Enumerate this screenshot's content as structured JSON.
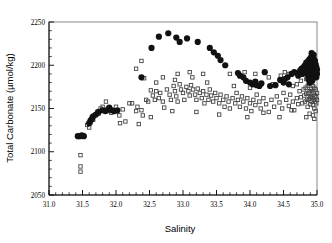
{
  "chart_data": {
    "type": "scatter",
    "title": "",
    "xlabel": "Salinity",
    "ylabel": "Total Carbonate (µmol/kg)",
    "xlim": [
      31.0,
      35.0
    ],
    "ylim": [
      2050,
      2250
    ],
    "xticks": [
      31.0,
      31.5,
      32.0,
      32.5,
      33.0,
      33.5,
      34.0,
      34.5,
      35.0
    ],
    "xticklabels": [
      "31.0",
      "31.5",
      "32.0",
      "32.5",
      "33.0",
      "33.5",
      "34.0",
      "34.5",
      "35.0"
    ],
    "yticks": [
      2050,
      2100,
      2150,
      2200,
      2250
    ],
    "yticklabels": [
      "2050",
      "2100",
      "2150",
      "2200",
      "2250"
    ],
    "x_minor_per_major": 5,
    "y_minor_per_major": 5,
    "grid": false,
    "legend": null,
    "colors": {
      "filled_marker": "#111111",
      "open_marker": "#444444",
      "axis": "#000000",
      "frame": "#888888",
      "background": "#ffffff"
    },
    "series": [
      {
        "name": "filled-circles",
        "marker": "filled-circle",
        "marker_size": 4.0,
        "points": [
          [
            31.43,
            2118
          ],
          [
            31.46,
            2118
          ],
          [
            31.49,
            2119
          ],
          [
            31.52,
            2118
          ],
          [
            31.6,
            2133
          ],
          [
            31.62,
            2136
          ],
          [
            31.64,
            2138
          ],
          [
            31.66,
            2141
          ],
          [
            31.7,
            2143
          ],
          [
            31.74,
            2146
          ],
          [
            31.8,
            2148
          ],
          [
            31.84,
            2147
          ],
          [
            31.86,
            2148
          ],
          [
            31.9,
            2151
          ],
          [
            31.94,
            2148
          ],
          [
            31.97,
            2147
          ],
          [
            32.02,
            2148
          ],
          [
            32.38,
            2186
          ],
          [
            32.53,
            2220
          ],
          [
            32.64,
            2233
          ],
          [
            32.78,
            2237
          ],
          [
            32.9,
            2232
          ],
          [
            32.95,
            2227
          ],
          [
            33.06,
            2231
          ],
          [
            33.22,
            2227
          ],
          [
            33.4,
            2220
          ],
          [
            33.46,
            2215
          ],
          [
            33.52,
            2211
          ],
          [
            33.56,
            2206
          ],
          [
            33.63,
            2200
          ],
          [
            33.82,
            2191
          ],
          [
            33.85,
            2188
          ],
          [
            33.9,
            2186
          ],
          [
            33.94,
            2182
          ],
          [
            34.0,
            2180
          ],
          [
            34.04,
            2178
          ],
          [
            34.08,
            2181
          ],
          [
            34.1,
            2177
          ],
          [
            34.14,
            2176
          ],
          [
            34.17,
            2179
          ],
          [
            34.22,
            2192
          ],
          [
            34.3,
            2176
          ],
          [
            34.38,
            2177
          ],
          [
            34.45,
            2183
          ],
          [
            34.5,
            2180
          ],
          [
            34.52,
            2184
          ],
          [
            34.56,
            2186
          ],
          [
            34.58,
            2178
          ],
          [
            34.62,
            2190
          ],
          [
            34.66,
            2192
          ],
          [
            34.7,
            2191
          ],
          [
            34.72,
            2188
          ],
          [
            34.75,
            2194
          ],
          [
            34.77,
            2196
          ],
          [
            34.78,
            2190
          ],
          [
            34.8,
            2198
          ],
          [
            34.81,
            2192
          ],
          [
            34.82,
            2200
          ],
          [
            34.83,
            2195
          ],
          [
            34.84,
            2203
          ],
          [
            34.85,
            2197
          ],
          [
            34.85,
            2190
          ],
          [
            34.86,
            2201
          ],
          [
            34.86,
            2193
          ],
          [
            34.87,
            2205
          ],
          [
            34.87,
            2196
          ],
          [
            34.88,
            2188
          ],
          [
            34.88,
            2199
          ],
          [
            34.89,
            2207
          ],
          [
            34.89,
            2192
          ],
          [
            34.9,
            2202
          ],
          [
            34.9,
            2195
          ],
          [
            34.9,
            2186
          ],
          [
            34.91,
            2209
          ],
          [
            34.91,
            2198
          ],
          [
            34.91,
            2190
          ],
          [
            34.92,
            2204
          ],
          [
            34.92,
            2194
          ],
          [
            34.92,
            2200
          ],
          [
            34.93,
            2188
          ],
          [
            34.93,
            2196
          ],
          [
            34.93,
            2206
          ],
          [
            34.94,
            2192
          ],
          [
            34.94,
            2201
          ],
          [
            34.94,
            2185
          ],
          [
            34.95,
            2198
          ],
          [
            34.95,
            2208
          ],
          [
            34.95,
            2190
          ],
          [
            34.96,
            2194
          ],
          [
            34.96,
            2203
          ],
          [
            34.96,
            2187
          ],
          [
            34.97,
            2199
          ],
          [
            34.97,
            2191
          ],
          [
            34.97,
            2205
          ],
          [
            34.98,
            2196
          ],
          [
            34.98,
            2189
          ],
          [
            34.98,
            2201
          ],
          [
            34.99,
            2193
          ],
          [
            34.99,
            2198
          ],
          [
            34.99,
            2186
          ],
          [
            35.0,
            2195
          ],
          [
            35.0,
            2190
          ],
          [
            34.87,
            2184
          ],
          [
            34.93,
            2182
          ],
          [
            34.89,
            2180
          ],
          [
            34.95,
            2212
          ],
          [
            34.92,
            2214
          ]
        ]
      },
      {
        "name": "open-squares",
        "marker": "open-square",
        "marker_size": 3.4,
        "points": [
          [
            31.47,
            2096
          ],
          [
            31.47,
            2083
          ],
          [
            31.47,
            2077
          ],
          [
            31.57,
            2131
          ],
          [
            31.6,
            2128
          ],
          [
            31.62,
            2134
          ],
          [
            31.64,
            2140
          ],
          [
            31.66,
            2137
          ],
          [
            31.7,
            2143
          ],
          [
            31.72,
            2146
          ],
          [
            31.74,
            2144
          ],
          [
            31.77,
            2150
          ],
          [
            31.8,
            2152
          ],
          [
            31.82,
            2148
          ],
          [
            31.85,
            2158
          ],
          [
            31.88,
            2150
          ],
          [
            31.9,
            2147
          ],
          [
            31.93,
            2145
          ],
          [
            31.96,
            2148
          ],
          [
            32.0,
            2152
          ],
          [
            32.02,
            2146
          ],
          [
            32.05,
            2142
          ],
          [
            32.1,
            2149
          ],
          [
            32.14,
            2135
          ],
          [
            32.2,
            2156
          ],
          [
            32.24,
            2156
          ],
          [
            32.3,
            2147
          ],
          [
            32.32,
            2152
          ],
          [
            32.38,
            2148
          ],
          [
            32.4,
            2142
          ],
          [
            32.45,
            2160
          ],
          [
            32.48,
            2158
          ],
          [
            32.52,
            2171
          ],
          [
            32.55,
            2165
          ],
          [
            32.58,
            2160
          ],
          [
            32.6,
            2170
          ],
          [
            32.64,
            2162
          ],
          [
            32.66,
            2168
          ],
          [
            32.7,
            2158
          ],
          [
            32.72,
            2151
          ],
          [
            32.76,
            2172
          ],
          [
            32.8,
            2166
          ],
          [
            32.82,
            2160
          ],
          [
            32.86,
            2176
          ],
          [
            32.88,
            2170
          ],
          [
            32.9,
            2164
          ],
          [
            32.92,
            2158
          ],
          [
            32.95,
            2178
          ],
          [
            32.97,
            2172
          ],
          [
            33.0,
            2168
          ],
          [
            33.02,
            2160
          ],
          [
            33.05,
            2175
          ],
          [
            33.08,
            2170
          ],
          [
            33.1,
            2165
          ],
          [
            33.12,
            2177
          ],
          [
            33.15,
            2172
          ],
          [
            33.18,
            2166
          ],
          [
            33.2,
            2160
          ],
          [
            33.22,
            2173
          ],
          [
            33.25,
            2168
          ],
          [
            33.28,
            2162
          ],
          [
            33.3,
            2170
          ],
          [
            33.32,
            2156
          ],
          [
            33.35,
            2166
          ],
          [
            33.38,
            2160
          ],
          [
            33.4,
            2172
          ],
          [
            33.42,
            2165
          ],
          [
            33.45,
            2158
          ],
          [
            33.48,
            2168
          ],
          [
            33.5,
            2162
          ],
          [
            33.54,
            2156
          ],
          [
            33.56,
            2166
          ],
          [
            33.6,
            2160
          ],
          [
            33.62,
            2152
          ],
          [
            33.65,
            2164
          ],
          [
            33.68,
            2158
          ],
          [
            33.7,
            2150
          ],
          [
            33.74,
            2162
          ],
          [
            33.78,
            2156
          ],
          [
            33.8,
            2168
          ],
          [
            33.82,
            2160
          ],
          [
            33.85,
            2152
          ],
          [
            33.88,
            2164
          ],
          [
            33.9,
            2158
          ],
          [
            33.94,
            2150
          ],
          [
            33.96,
            2162
          ],
          [
            34.0,
            2156
          ],
          [
            34.02,
            2147
          ],
          [
            34.05,
            2160
          ],
          [
            34.08,
            2154
          ],
          [
            34.1,
            2166
          ],
          [
            34.14,
            2158
          ],
          [
            34.16,
            2150
          ],
          [
            34.2,
            2162
          ],
          [
            34.24,
            2155
          ],
          [
            34.28,
            2146
          ],
          [
            34.32,
            2160
          ],
          [
            34.36,
            2152
          ],
          [
            34.4,
            2164
          ],
          [
            34.44,
            2157
          ],
          [
            34.48,
            2150
          ],
          [
            34.5,
            2168
          ],
          [
            34.54,
            2160
          ],
          [
            34.58,
            2153
          ],
          [
            34.6,
            2166
          ],
          [
            34.64,
            2158
          ],
          [
            34.66,
            2148
          ],
          [
            34.7,
            2162
          ],
          [
            34.72,
            2155
          ],
          [
            34.74,
            2170
          ],
          [
            34.76,
            2163
          ],
          [
            34.78,
            2156
          ],
          [
            34.8,
            2172
          ],
          [
            34.81,
            2165
          ],
          [
            34.82,
            2158
          ],
          [
            34.83,
            2174
          ],
          [
            34.84,
            2167
          ],
          [
            34.85,
            2160
          ],
          [
            34.86,
            2176
          ],
          [
            34.86,
            2152
          ],
          [
            34.87,
            2168
          ],
          [
            34.88,
            2161
          ],
          [
            34.88,
            2178
          ],
          [
            34.89,
            2170
          ],
          [
            34.9,
            2163
          ],
          [
            34.9,
            2155
          ],
          [
            34.91,
            2172
          ],
          [
            34.91,
            2164
          ],
          [
            34.92,
            2180
          ],
          [
            34.92,
            2158
          ],
          [
            34.93,
            2170
          ],
          [
            34.93,
            2162
          ],
          [
            34.94,
            2176
          ],
          [
            34.94,
            2154
          ],
          [
            34.95,
            2168
          ],
          [
            34.95,
            2160
          ],
          [
            34.96,
            2174
          ],
          [
            34.96,
            2150
          ],
          [
            34.97,
            2165
          ],
          [
            34.97,
            2158
          ],
          [
            34.98,
            2172
          ],
          [
            34.98,
            2147
          ],
          [
            34.99,
            2163
          ],
          [
            34.99,
            2156
          ],
          [
            35.0,
            2168
          ],
          [
            35.0,
            2160
          ],
          [
            34.89,
            2144
          ],
          [
            34.94,
            2142
          ],
          [
            34.84,
            2140
          ],
          [
            34.96,
            2138
          ],
          [
            34.62,
            2148
          ],
          [
            34.44,
            2140
          ],
          [
            34.2,
            2145
          ],
          [
            33.96,
            2140
          ],
          [
            33.54,
            2143
          ],
          [
            33.2,
            2146
          ],
          [
            32.84,
            2147
          ],
          [
            32.52,
            2140
          ],
          [
            32.34,
            2132
          ],
          [
            32.06,
            2133
          ],
          [
            34.28,
            2186
          ],
          [
            34.46,
            2188
          ],
          [
            34.52,
            2192
          ],
          [
            34.58,
            2190
          ],
          [
            34.08,
            2190
          ],
          [
            33.92,
            2192
          ],
          [
            33.7,
            2190
          ],
          [
            33.3,
            2190
          ],
          [
            33.1,
            2192
          ],
          [
            32.92,
            2190
          ],
          [
            32.7,
            2186
          ],
          [
            32.42,
            2185
          ],
          [
            32.3,
            2196
          ],
          [
            32.38,
            2205
          ],
          [
            32.6,
            2180
          ],
          [
            32.88,
            2183
          ],
          [
            33.14,
            2186
          ],
          [
            34.7,
            2178
          ],
          [
            34.76,
            2182
          ],
          [
            34.84,
            2184
          ],
          [
            34.9,
            2182
          ],
          [
            34.64,
            2176
          ],
          [
            34.34,
            2178
          ],
          [
            34.0,
            2174
          ],
          [
            33.76,
            2176
          ],
          [
            33.36,
            2180
          ]
        ]
      }
    ]
  }
}
